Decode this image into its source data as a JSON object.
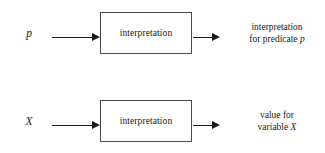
{
  "diagram": {
    "background_color": "#ffffff",
    "line_color": "#1a1a1a",
    "box_border_color": "#4a4a4a",
    "rows": [
      {
        "id": "predicate",
        "input_label": "p",
        "input_arrow": "arrow-right",
        "box_label": "interpretation",
        "output_arrow": "arrow-right",
        "output_line_1": "interpretation",
        "output_line_2_prefix": "for predicate ",
        "output_line_2_symbol": "p"
      },
      {
        "id": "variable",
        "input_label": "X",
        "input_arrow": "arrow-right",
        "box_label": "interpretation",
        "output_arrow": "arrow-right",
        "output_line_1": "value for",
        "output_line_2_prefix": "variable ",
        "output_line_2_symbol": "X"
      }
    ]
  }
}
